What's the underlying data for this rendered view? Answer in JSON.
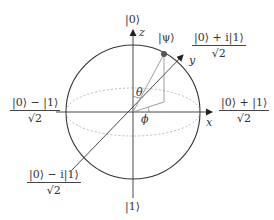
{
  "diagram": {
    "colors": {
      "sphere": "#333333",
      "axes": "#444444",
      "equator_dashed": "#aaaaaa",
      "state_vector": "#888888",
      "state_point": "#555555"
    },
    "axes": {
      "z": {
        "label": "z",
        "top_state": "|0⟩",
        "bottom_state": "|1⟩"
      },
      "x": {
        "label": "x",
        "state_num": "|0⟩ + |1⟩",
        "state_den": "√2"
      },
      "y": {
        "label": "y",
        "state_num": "|0⟩ + i|1⟩",
        "state_den": "√2"
      },
      "neg_x": {
        "state_num": "|0⟩ − |1⟩",
        "state_den": "√2"
      },
      "neg_y": {
        "state_num": "|0⟩ − i|1⟩",
        "state_den": "√2"
      }
    },
    "state": {
      "label": "|ψ⟩"
    },
    "angles": {
      "theta": "θ",
      "phi": "ϕ"
    }
  }
}
